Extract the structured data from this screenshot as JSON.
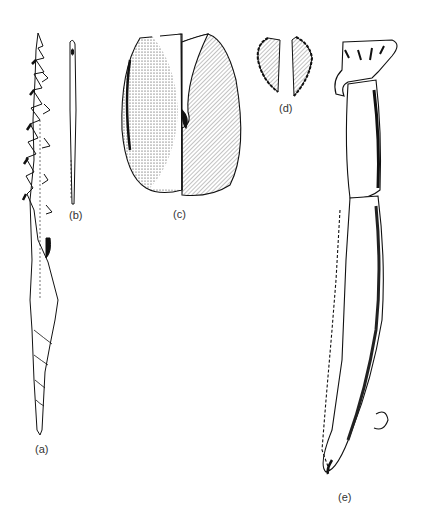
{
  "figure": {
    "items": [
      {
        "id": "a",
        "label": "(a)",
        "depicts": "barbed harpoon point"
      },
      {
        "id": "b",
        "label": "(b)",
        "depicts": "bone needle with eye"
      },
      {
        "id": "c",
        "label": "(c)",
        "depicts": "stone lamp / hollowed stone, sectioned"
      },
      {
        "id": "d",
        "label": "(d)",
        "depicts": "pair of small flint pieces"
      },
      {
        "id": "e",
        "label": "(e)",
        "depicts": "antler/bone tool with carved animal-head terminal"
      }
    ],
    "colors": {
      "ink": "#111111",
      "paper": "#ffffff",
      "label": "#333333"
    }
  }
}
